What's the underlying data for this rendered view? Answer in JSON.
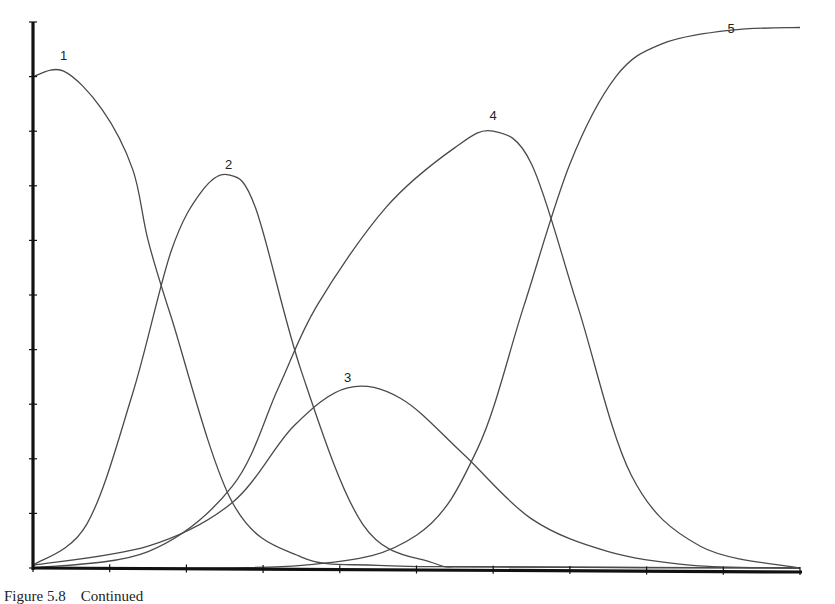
{
  "figure": {
    "caption": "Figure 5.8    Continued"
  },
  "chart_data": {
    "type": "line",
    "title": "",
    "xlabel": "",
    "ylabel": "",
    "xlim": [
      0,
      10
    ],
    "ylim": [
      0,
      10
    ],
    "x_ticks": [
      0,
      1,
      2,
      3,
      4,
      5,
      6,
      7,
      8,
      9,
      10
    ],
    "y_ticks": [
      0,
      1,
      2,
      3,
      4,
      5,
      6,
      7,
      8,
      9,
      10
    ],
    "grid": false,
    "legend": "inline numeric labels at curve peaks",
    "series": [
      {
        "name": "1",
        "label_pos": [
          0.4,
          9.3
        ],
        "x": [
          0,
          0.4,
          0.9,
          1.3,
          1.5,
          1.8,
          2.6,
          3.5,
          4.5,
          6,
          10
        ],
        "y": [
          9.0,
          9.1,
          8.4,
          7.3,
          6.0,
          4.6,
          1.2,
          0.2,
          0.05,
          0.02,
          0
        ]
      },
      {
        "name": "2",
        "label_pos": [
          2.55,
          7.3
        ],
        "x": [
          0,
          0.7,
          1.3,
          1.8,
          2.2,
          2.55,
          2.9,
          3.5,
          4.3,
          5.2,
          6,
          10
        ],
        "y": [
          0.05,
          0.8,
          3.2,
          5.8,
          6.9,
          7.2,
          6.6,
          3.6,
          0.8,
          0.1,
          0.02,
          0
        ]
      },
      {
        "name": "3",
        "label_pos": [
          4.1,
          3.4
        ],
        "x": [
          0,
          1.5,
          2.6,
          3.4,
          4.1,
          4.8,
          5.6,
          6.5,
          7.5,
          8.6,
          10
        ],
        "y": [
          0.05,
          0.4,
          1.2,
          2.6,
          3.3,
          3.1,
          2.1,
          0.9,
          0.3,
          0.05,
          0
        ]
      },
      {
        "name": "4",
        "label_pos": [
          6.0,
          8.2
        ],
        "x": [
          0,
          1.5,
          2.6,
          3.2,
          3.7,
          4.6,
          5.5,
          6.0,
          6.5,
          7.1,
          7.8,
          8.7,
          10
        ],
        "y": [
          0,
          0.3,
          1.5,
          3.3,
          4.8,
          6.6,
          7.7,
          8.0,
          7.4,
          4.8,
          1.7,
          0.4,
          0
        ]
      },
      {
        "name": "5",
        "label_pos": [
          9.1,
          9.8
        ],
        "x": [
          0,
          3.5,
          5.0,
          5.8,
          6.4,
          7.0,
          7.6,
          8.2,
          9.1,
          10
        ],
        "y": [
          0,
          0.05,
          0.6,
          2.2,
          4.8,
          7.4,
          9.0,
          9.6,
          9.85,
          9.9
        ]
      }
    ]
  }
}
